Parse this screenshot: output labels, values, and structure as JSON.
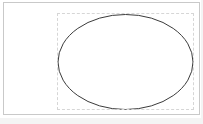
{
  "app": {
    "surface_name": "drawing-canvas",
    "background_color": "#ffffff",
    "width": 203,
    "height": 124
  },
  "canvas": {
    "frame_name": "document-frame",
    "frame_border_color": "#c9c9c9",
    "frame_fill_color": "#ffffff",
    "frame_x": 3,
    "frame_y": 2,
    "frame_width": 197,
    "frame_height": 113
  },
  "page_shade": {
    "color": "#f4f4f4"
  },
  "selection": {
    "label": "",
    "state": "selected",
    "box_color": "#d6d6d6",
    "box_style": "dashed",
    "box_x": 56,
    "box_y": 12,
    "box_width": 137,
    "box_height": 97
  },
  "shapes": [
    {
      "type": "ellipse",
      "name": "ellipse-shape",
      "stroke_color": "#3b3b3b",
      "stroke_width": 1,
      "fill": "none",
      "cx": 124.5,
      "cy": 61,
      "rx": 67.5,
      "ry": 47.5
    }
  ],
  "chart_data": {
    "type": "scatter",
    "title": "",
    "xlabel": "",
    "ylabel": "",
    "x": [],
    "values": [],
    "categories": []
  }
}
